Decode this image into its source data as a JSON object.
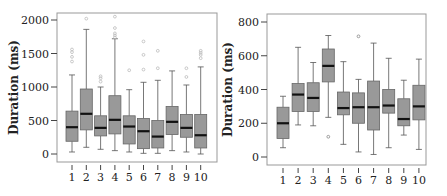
{
  "chart_data": [
    {
      "type": "boxplot",
      "title": "",
      "xlabel": "",
      "ylabel": "Duration (ms)",
      "ylim": [
        -100,
        2100
      ],
      "yticks": [
        0,
        500,
        1000,
        1500,
        2000
      ],
      "categories": [
        "1",
        "2",
        "3",
        "4",
        "5",
        "6",
        "7",
        "8",
        "9",
        "10"
      ],
      "grid": false,
      "box_color": "#999999",
      "median_color": "#111111",
      "outlier_color": "#bbbbbb",
      "boxes": [
        {
          "label": "1",
          "whisker_low": 30,
          "q1": 190,
          "median": 400,
          "q3": 640,
          "whisker_high": 1180,
          "outliers": [
            1380,
            1450,
            1520,
            1560
          ]
        },
        {
          "label": "2",
          "whisker_low": 100,
          "q1": 360,
          "median": 600,
          "q3": 970,
          "whisker_high": 1860,
          "outliers": [
            2020
          ]
        },
        {
          "label": "3",
          "whisker_low": 70,
          "q1": 270,
          "median": 390,
          "q3": 570,
          "whisker_high": 1000,
          "outliers": [
            1080,
            1130,
            1160
          ]
        },
        {
          "label": "4",
          "whisker_low": 50,
          "q1": 300,
          "median": 510,
          "q3": 870,
          "whisker_high": 1720,
          "outliers": [
            1740,
            1770,
            1800,
            1880,
            2050
          ]
        },
        {
          "label": "5",
          "whisker_low": 30,
          "q1": 150,
          "median": 410,
          "q3": 570,
          "whisker_high": 960,
          "outliers": [
            1250
          ]
        },
        {
          "label": "6",
          "whisker_low": 10,
          "q1": 80,
          "median": 340,
          "q3": 530,
          "whisker_high": 1070,
          "outliers": [
            1260,
            1480,
            1680
          ]
        },
        {
          "label": "7",
          "whisker_low": 10,
          "q1": 90,
          "median": 260,
          "q3": 500,
          "whisker_high": 1100,
          "outliers": [
            1280,
            1540
          ]
        },
        {
          "label": "8",
          "whisker_low": 50,
          "q1": 290,
          "median": 480,
          "q3": 710,
          "whisker_high": 1240,
          "outliers": []
        },
        {
          "label": "9",
          "whisker_low": 30,
          "q1": 250,
          "median": 390,
          "q3": 590,
          "whisker_high": 1030,
          "outliers": [
            1150,
            1280
          ]
        },
        {
          "label": "10",
          "whisker_low": 0,
          "q1": 90,
          "median": 280,
          "q3": 590,
          "whisker_high": 1300,
          "outliers": [
            1430,
            1480,
            1510,
            1540
          ]
        }
      ]
    },
    {
      "type": "boxplot",
      "title": "",
      "xlabel": "",
      "ylabel": "Duration (ms)",
      "ylim": [
        -45,
        845
      ],
      "yticks": [
        0,
        200,
        400,
        600,
        800
      ],
      "categories": [
        "1",
        "2",
        "3",
        "4",
        "5",
        "6",
        "7",
        "8",
        "9",
        "10"
      ],
      "grid": false,
      "box_color": "#999999",
      "median_color": "#111111",
      "outlier_color": "#888888",
      "boxes": [
        {
          "label": "1",
          "whisker_low": 55,
          "q1": 110,
          "median": 200,
          "q3": 295,
          "whisker_high": 360,
          "outliers": []
        },
        {
          "label": "2",
          "whisker_low": 190,
          "q1": 270,
          "median": 370,
          "q3": 435,
          "whisker_high": 650,
          "outliers": []
        },
        {
          "label": "3",
          "whisker_low": 185,
          "q1": 270,
          "median": 350,
          "q3": 440,
          "whisker_high": 560,
          "outliers": []
        },
        {
          "label": "4",
          "whisker_low": 235,
          "q1": 445,
          "median": 540,
          "q3": 640,
          "whisker_high": 720,
          "outliers": [
            120
          ]
        },
        {
          "label": "5",
          "whisker_low": 75,
          "q1": 250,
          "median": 290,
          "q3": 385,
          "whisker_high": 565,
          "outliers": []
        },
        {
          "label": "6",
          "whisker_low": 30,
          "q1": 200,
          "median": 295,
          "q3": 380,
          "whisker_high": 460,
          "outliers": [
            715
          ]
        },
        {
          "label": "7",
          "whisker_low": 15,
          "q1": 160,
          "median": 295,
          "q3": 450,
          "whisker_high": 675,
          "outliers": []
        },
        {
          "label": "8",
          "whisker_low": 55,
          "q1": 260,
          "median": 305,
          "q3": 400,
          "whisker_high": 585,
          "outliers": []
        },
        {
          "label": "9",
          "whisker_low": 130,
          "q1": 185,
          "median": 225,
          "q3": 345,
          "whisker_high": 455,
          "outliers": []
        },
        {
          "label": "10",
          "whisker_low": 45,
          "q1": 220,
          "median": 300,
          "q3": 425,
          "whisker_high": 580,
          "outliers": []
        }
      ]
    }
  ],
  "layout": {
    "panels": [
      {
        "frame": {
          "x": 57,
          "y": 13,
          "w": 160,
          "h": 149
        },
        "y0_px": 154,
        "ytop_px": 20,
        "ytop_val": 2000,
        "x_first": 72,
        "x_step": 14.3,
        "box_w": 12,
        "ylabel_x": 18
      },
      {
        "frame": {
          "x": 267,
          "y": 14,
          "w": 159,
          "h": 151
        },
        "y0_px": 157,
        "ytop_px": 22,
        "ytop_val": 800,
        "x_first": 283,
        "x_step": 15.1,
        "box_w": 12,
        "ylabel_x": 232
      }
    ]
  }
}
